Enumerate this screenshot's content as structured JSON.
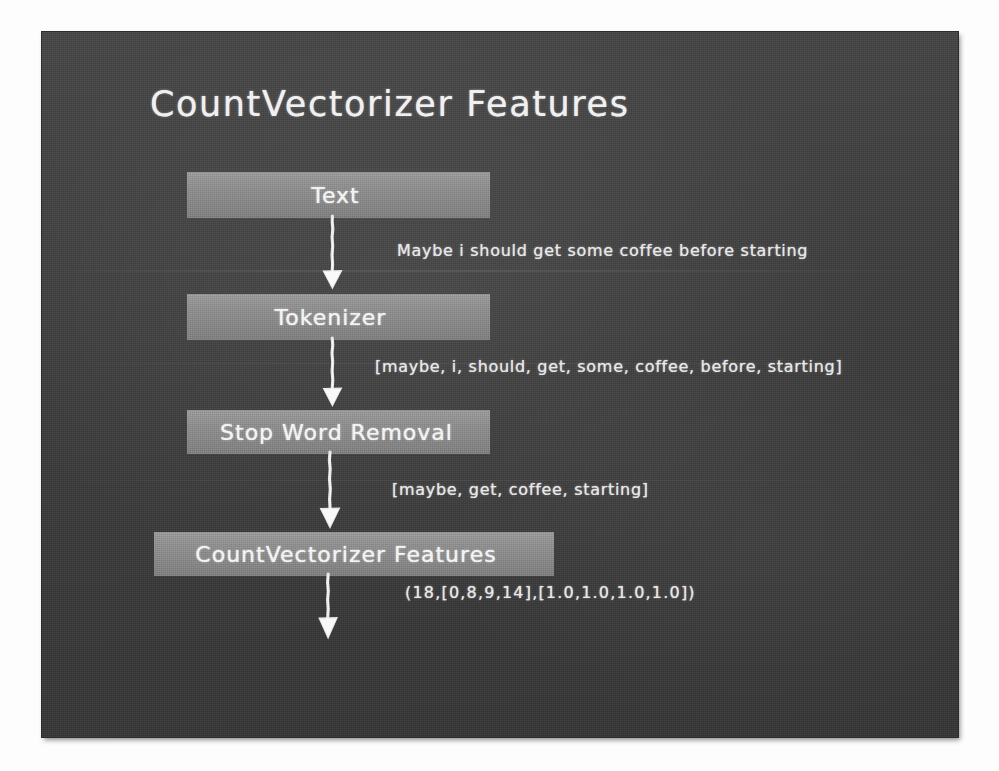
{
  "slide": {
    "title": "CountVectorizer Features",
    "background_color": "#3c3c3c",
    "box_color": "#8d8d8d",
    "chalk_color": "#ececec"
  },
  "diagram": {
    "type": "flowchart",
    "orientation": "top-to-bottom",
    "nodes": [
      {
        "id": "text",
        "label": "Text"
      },
      {
        "id": "tokenizer",
        "label": "Tokenizer"
      },
      {
        "id": "stopword",
        "label": "Stop Word Removal"
      },
      {
        "id": "countvec",
        "label": "CountVectorizer Features"
      }
    ],
    "edges": [
      {
        "from": "text",
        "to": "tokenizer",
        "annotation": "Maybe i should get some coffee before starting"
      },
      {
        "from": "tokenizer",
        "to": "stopword",
        "annotation": "[maybe, i, should, get, some, coffee, before, starting]"
      },
      {
        "from": "stopword",
        "to": "countvec",
        "annotation": "[maybe, get, coffee, starting]"
      },
      {
        "from": "countvec",
        "to": "output",
        "annotation": "(18,[0,8,9,14],[1.0,1.0,1.0,1.0])"
      }
    ]
  }
}
